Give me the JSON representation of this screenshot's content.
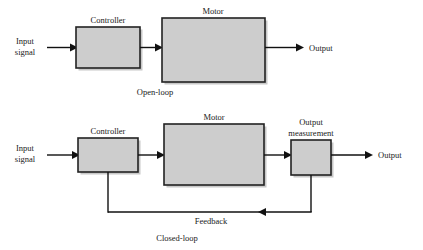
{
  "figure": {
    "background_color": "#ffffff",
    "box_fill_color": "#cdcdcd",
    "box_border_color": "#222222",
    "line_color": "#111111",
    "text_color": "#1a1a1a"
  },
  "open_loop": {
    "caption": "Open-loop",
    "input_label_line1": "Input",
    "input_label_line2": "signal",
    "output_label": "Output",
    "blocks": [
      {
        "label": "Controller",
        "x": 76,
        "y": 27,
        "w": 64,
        "h": 41
      },
      {
        "label": "Motor",
        "x": 162,
        "y": 18,
        "w": 103,
        "h": 64
      }
    ]
  },
  "closed_loop": {
    "caption": "Closed-loop",
    "input_label_line1": "Input",
    "input_label_line2": "signal",
    "output_label": "Output",
    "feedback_label": "Feedback",
    "blocks": [
      {
        "label": "Controller",
        "x": 78,
        "y": 138,
        "w": 60,
        "h": 34
      },
      {
        "label": "Motor",
        "x": 164,
        "y": 124,
        "w": 100,
        "h": 61
      },
      {
        "label_line1": "Output",
        "label_line2": "measurement",
        "x": 291,
        "y": 140,
        "w": 40,
        "h": 35
      }
    ]
  }
}
